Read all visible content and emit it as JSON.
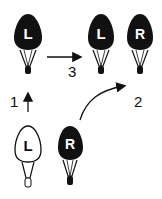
{
  "diagram": {
    "bulbs": [
      {
        "id": "top-left",
        "letter": "L",
        "fill": "black"
      },
      {
        "id": "top-middle",
        "letter": "L",
        "fill": "black"
      },
      {
        "id": "top-right",
        "letter": "R",
        "fill": "black"
      },
      {
        "id": "bottom-left",
        "letter": "L",
        "fill": "white"
      },
      {
        "id": "bottom-right",
        "letter": "R",
        "fill": "black"
      }
    ],
    "steps": [
      {
        "label": "1",
        "direction": "up"
      },
      {
        "label": "2",
        "direction": "curved-up-right"
      },
      {
        "label": "3",
        "direction": "right"
      }
    ],
    "colors": {
      "ink": "#111111",
      "background": "#ffffff"
    }
  }
}
